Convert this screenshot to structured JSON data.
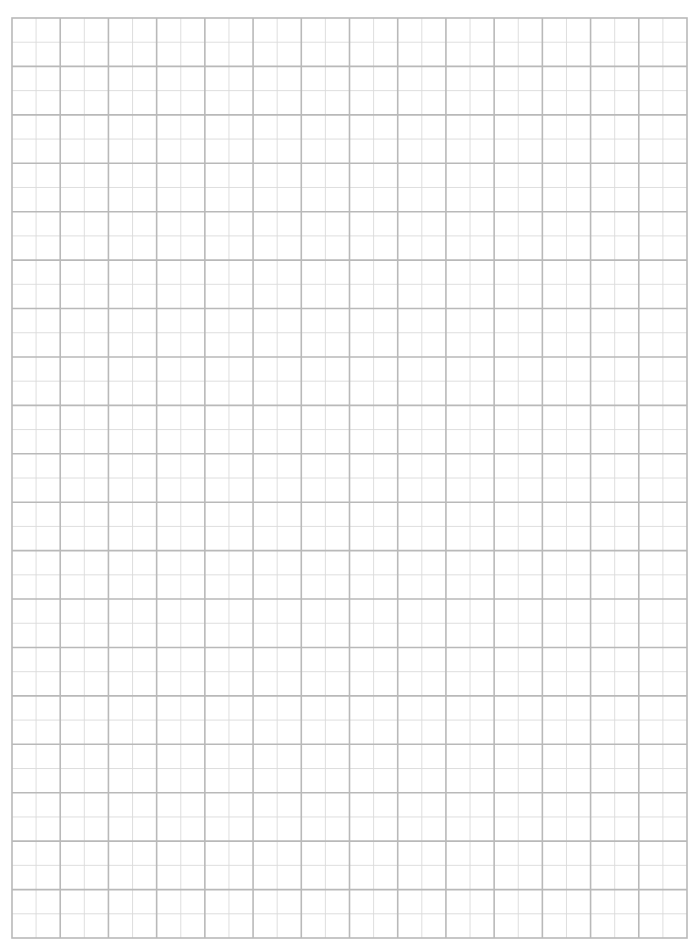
{
  "page": {
    "type": "graph-paper",
    "background": "#ffffff"
  },
  "grid": {
    "left": 12,
    "top": 18,
    "right": 687,
    "bottom": 938,
    "major_columns": 14,
    "major_rows": 19,
    "minor_subdivisions": 2,
    "major_color": "#b9b9b9",
    "minor_color": "#dadada",
    "border_color": "#b9b9b9",
    "major_width": 1.6,
    "minor_width": 0.9,
    "border_width": 1.6
  }
}
